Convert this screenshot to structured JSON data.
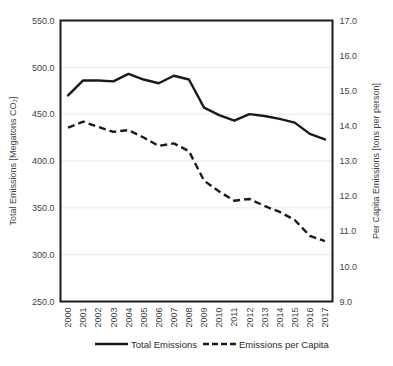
{
  "chart_data": {
    "type": "line",
    "title": "",
    "xlabel": "",
    "ylabel": "Total Emissions  [Megatons CO₂]",
    "y2label": "Per Capita Emissions [tons per person]",
    "grid": true,
    "legend_position": "bottom",
    "categories": [
      "2000",
      "2001",
      "2002",
      "2003",
      "2004",
      "2005",
      "2006",
      "2007",
      "2008",
      "2009",
      "2010",
      "2011",
      "2012",
      "2013",
      "2014",
      "2015",
      "2016",
      "2017"
    ],
    "ylim": [
      250.0,
      550.0
    ],
    "ytick_labels": [
      "550.0",
      "500.0",
      "450.0",
      "400.0",
      "350.0",
      "300.0",
      "250.0"
    ],
    "yticks": [
      550.0,
      500.0,
      450.0,
      400.0,
      350.0,
      300.0,
      250.0
    ],
    "y2lim": [
      9.0,
      17.0
    ],
    "y2tick_labels": [
      "17.0",
      "16.0",
      "15.0",
      "14.0",
      "13.0",
      "12.0",
      "11.0",
      "10.0",
      "9.0"
    ],
    "y2ticks": [
      17.0,
      16.0,
      15.0,
      14.0,
      13.0,
      12.0,
      11.0,
      10.0,
      9.0
    ],
    "series": [
      {
        "name": "Total Emissions",
        "axis": "left",
        "style": "solid",
        "color": "#1a1a1a",
        "values": [
          470.0,
          486.0,
          486.0,
          485.0,
          493.0,
          487.0,
          483.0,
          491.0,
          487.0,
          457.0,
          449.0,
          443.0,
          450.0,
          448.0,
          445.0,
          441.0,
          429.0,
          423.0
        ]
      },
      {
        "name": "Emissions per Capita",
        "axis": "right",
        "style": "dashed",
        "color": "#1a1a1a",
        "values": [
          13.95,
          14.12,
          13.97,
          13.83,
          13.88,
          13.67,
          13.43,
          13.5,
          13.28,
          12.44,
          12.13,
          11.87,
          11.92,
          11.72,
          11.55,
          11.32,
          10.87,
          10.72
        ]
      }
    ],
    "legend": [
      {
        "label": "Total Emissions",
        "style": "solid"
      },
      {
        "label": "Emissions per Capita",
        "style": "dashed"
      }
    ]
  }
}
